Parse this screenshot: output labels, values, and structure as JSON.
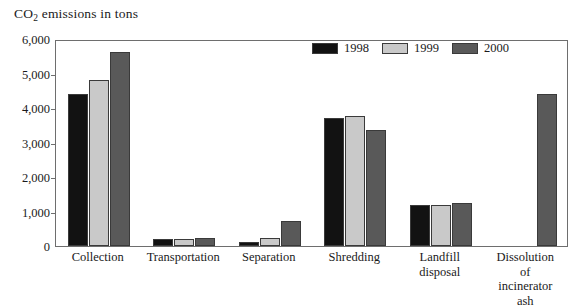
{
  "chart_data": {
    "type": "bar",
    "title": "CO2 emissions in tons",
    "title_prefix": "CO",
    "title_subscript": "2",
    "title_suffix": " emissions in tons",
    "xlabel": "",
    "ylabel": "CO2 emissions in tons",
    "ylim": [
      0,
      6000
    ],
    "ytick_labels": [
      "0",
      "1,000",
      "2,000",
      "3,000",
      "4,000",
      "5,000",
      "6,000"
    ],
    "ytick_values": [
      0,
      1000,
      2000,
      3000,
      4000,
      5000,
      6000
    ],
    "grid": false,
    "legend_position": "top-right",
    "categories": [
      "Collection",
      "Transportation",
      "Separation",
      "Shredding",
      "Landfill\ndisposal",
      "Dissolution of\nincinerator ash"
    ],
    "series": [
      {
        "name": "1998",
        "color": "#121212",
        "values": [
          4400,
          210,
          130,
          3720,
          1180,
          null
        ]
      },
      {
        "name": "1999",
        "color": "#c9c9c9",
        "values": [
          4800,
          200,
          220,
          3780,
          1180,
          null
        ]
      },
      {
        "name": "2000",
        "color": "#595959",
        "values": [
          5620,
          230,
          730,
          3350,
          1240,
          4400
        ]
      }
    ]
  },
  "legend": {
    "entries": [
      {
        "label": "1998",
        "color": "#121212"
      },
      {
        "label": "1999",
        "color": "#c9c9c9"
      },
      {
        "label": "2000",
        "color": "#595959"
      }
    ]
  },
  "axis": {
    "tick_labels": [
      "6,000",
      "5,000",
      "4,000",
      "3,000",
      "2,000",
      "1,000",
      "0"
    ]
  }
}
